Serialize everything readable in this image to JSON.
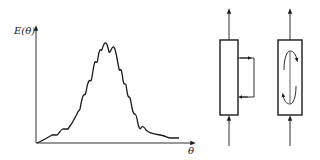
{
  "figure": {
    "left_panel": {
      "type": "residence-time-distribution-plot",
      "y_axis_label": "E(θ)",
      "x_axis_label": "θ",
      "curve_description": "bell-shaped distribution with superimposed periodic oscillations (internal recirculation signature)"
    },
    "right_panel": {
      "diagrams": [
        {
          "name": "vessel-with-external-recycle",
          "has_external_loop": true
        },
        {
          "name": "vessel-with-internal-circulation",
          "has_internal_loop": true
        }
      ]
    }
  },
  "colors": {
    "line": "#1a1a1a",
    "background": "#ffffff"
  }
}
